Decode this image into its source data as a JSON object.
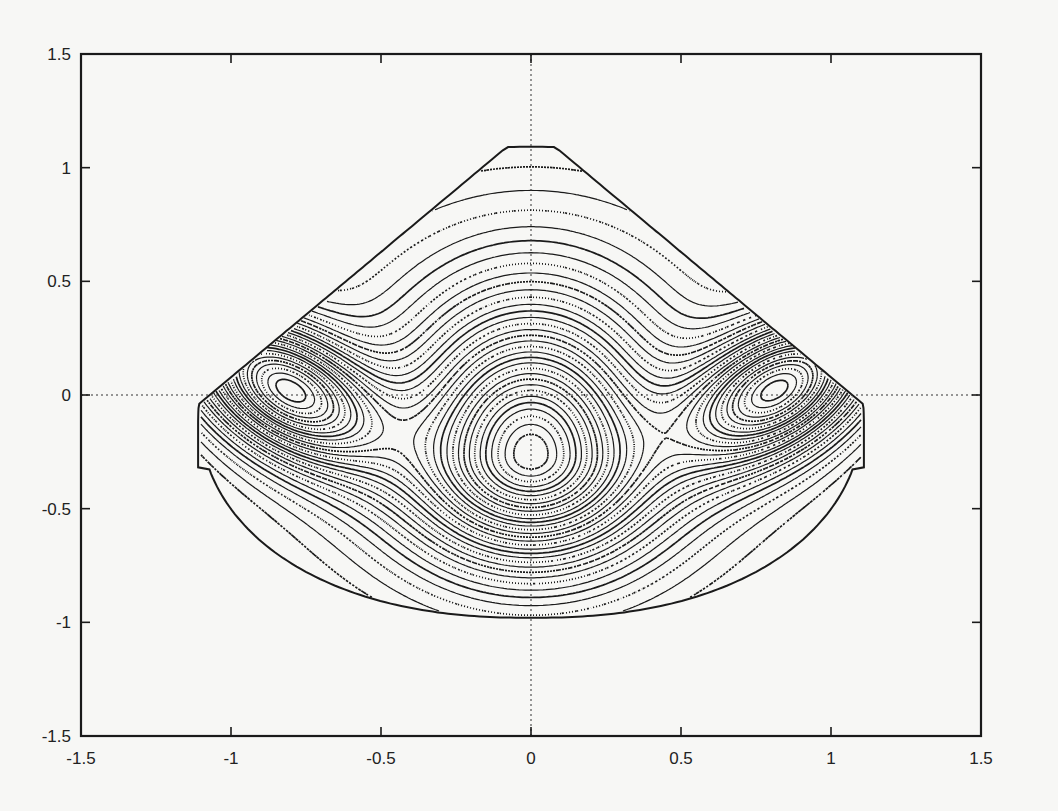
{
  "figure": {
    "background": "#f7f7f5",
    "ink": "#1a1a1a",
    "frame_px": {
      "left": 81,
      "right": 981,
      "top": 54,
      "bottom": 736
    }
  },
  "chart_data": {
    "type": "contour",
    "title": "",
    "xlabel": "",
    "ylabel": "",
    "xlim": [
      -1.5,
      1.5
    ],
    "ylim": [
      -1.5,
      1.5
    ],
    "xticks": [
      "-1.5",
      "-1",
      "-0.5",
      "0",
      "0.5",
      "1",
      "1.5"
    ],
    "yticks": [
      "1.5",
      "1",
      "0.5",
      "0",
      "-0.5",
      "-1",
      "-1.5"
    ],
    "grid": false,
    "zero_lines": {
      "x0": true,
      "y0": true,
      "style": "dotted"
    },
    "legend": null,
    "boundary": {
      "apex": [
        0.0,
        1.18
      ],
      "left_extreme": [
        -1.1,
        -0.1
      ],
      "right_extreme": [
        1.1,
        -0.1
      ],
      "bottom": [
        0.0,
        -0.97
      ]
    },
    "centers": [
      {
        "name": "left-lobe",
        "x": -0.82,
        "y": 0.03
      },
      {
        "name": "center-lobe",
        "x": 0.0,
        "y": -0.27
      },
      {
        "name": "right-lobe",
        "x": 0.83,
        "y": 0.03
      }
    ],
    "contour_levels": 34
  }
}
